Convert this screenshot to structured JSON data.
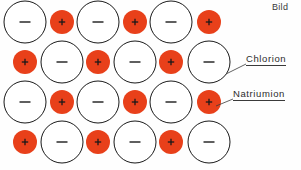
{
  "figure": {
    "title_caption": "Bild",
    "background_color": "#fefefe"
  },
  "labels": {
    "chlorion": "Chlorion",
    "natriumion": "Natriumion"
  },
  "legend": {
    "anion_symbol": "−",
    "cation_symbol": "+"
  },
  "colors": {
    "cation_fill": "#E8401A",
    "anion_fill": "#ffffff",
    "outline": "#1a1a1a",
    "symbol": "#1a1a1a",
    "leader_line": "#3a3a3a"
  },
  "geometry": {
    "anion_radius": 21,
    "cation_radius": 12,
    "rows": 4
  },
  "lattice": {
    "rows": [
      {
        "row_index": 1,
        "y": 22,
        "ions": [
          {
            "type": "anion",
            "x": 25,
            "symbol": "−"
          },
          {
            "type": "cation",
            "x": 62,
            "symbol": "+"
          },
          {
            "type": "anion",
            "x": 98,
            "symbol": "−"
          },
          {
            "type": "cation",
            "x": 135,
            "symbol": "+"
          },
          {
            "type": "anion",
            "x": 171,
            "symbol": "−"
          },
          {
            "type": "cation",
            "x": 209,
            "symbol": "+"
          }
        ]
      },
      {
        "row_index": 2,
        "y": 62,
        "ions": [
          {
            "type": "cation",
            "x": 25,
            "symbol": "+"
          },
          {
            "type": "anion",
            "x": 62,
            "symbol": "−"
          },
          {
            "type": "cation",
            "x": 98,
            "symbol": "+"
          },
          {
            "type": "anion",
            "x": 135,
            "symbol": "−"
          },
          {
            "type": "cation",
            "x": 171,
            "symbol": "+"
          },
          {
            "type": "anion",
            "x": 209,
            "symbol": "−"
          }
        ]
      },
      {
        "row_index": 3,
        "y": 102,
        "ions": [
          {
            "type": "anion",
            "x": 25,
            "symbol": "−"
          },
          {
            "type": "cation",
            "x": 62,
            "symbol": "+"
          },
          {
            "type": "anion",
            "x": 98,
            "symbol": "−"
          },
          {
            "type": "cation",
            "x": 135,
            "symbol": "+"
          },
          {
            "type": "anion",
            "x": 171,
            "symbol": "−"
          },
          {
            "type": "cation",
            "x": 209,
            "symbol": "+"
          }
        ]
      },
      {
        "row_index": 4,
        "y": 142,
        "ions": [
          {
            "type": "cation",
            "x": 25,
            "symbol": "+"
          },
          {
            "type": "anion",
            "x": 62,
            "symbol": "−"
          },
          {
            "type": "cation",
            "x": 98,
            "symbol": "+"
          },
          {
            "type": "anion",
            "x": 135,
            "symbol": "−"
          },
          {
            "type": "cation",
            "x": 171,
            "symbol": "+"
          },
          {
            "type": "anion",
            "x": 209,
            "symbol": "−"
          }
        ]
      }
    ]
  },
  "leaders": [
    {
      "name": "chlorion-leader",
      "x1": 226,
      "y1": 74,
      "x2": 246,
      "y2": 64
    },
    {
      "name": "natriumion-leader",
      "x1": 216,
      "y1": 106,
      "x2": 233,
      "y2": 99
    }
  ]
}
